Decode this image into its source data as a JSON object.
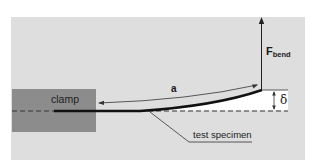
{
  "diagram": {
    "labels": {
      "clamp": "clamp",
      "arc_length": "a",
      "force": "F",
      "force_subscript": "bend",
      "deflection": "δ",
      "specimen": "test specimen"
    },
    "colors": {
      "background": "#dedede",
      "clamp": "#8c8c8c",
      "specimen": "#111111",
      "deflection_region": "#ffffff",
      "lines": "#222222"
    }
  }
}
